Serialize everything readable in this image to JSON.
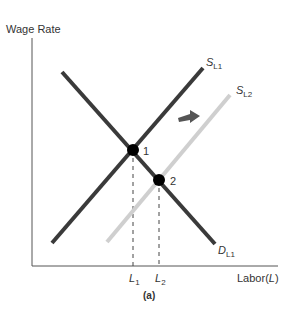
{
  "diagram": {
    "y_axis_label": "Wage Rate",
    "x_axis_label_prefix": "Labor(",
    "x_axis_label_var": "L",
    "x_axis_label_suffix": ")",
    "caption": "(a)",
    "shift_arrow_icon": "right-arrow-icon"
  },
  "curves": {
    "supply_1": {
      "main": "S",
      "sub": "L1",
      "color": "#3a3a3a",
      "from": [
        52,
        243
      ],
      "to": [
        203,
        68
      ]
    },
    "supply_2": {
      "main": "S",
      "sub": "L2",
      "color": "#cfcfcf",
      "from": [
        107,
        242
      ],
      "to": [
        230,
        95
      ]
    },
    "demand_1": {
      "main": "D",
      "sub": "L1",
      "color": "#3a3a3a",
      "from": [
        62,
        72
      ],
      "to": [
        215,
        244
      ]
    }
  },
  "equilibria": [
    {
      "label": "1",
      "x": 133,
      "y": 150
    },
    {
      "label": "2",
      "x": 159,
      "y": 180
    }
  ],
  "ticks": [
    {
      "main": "L",
      "sub": "1",
      "x": 135
    },
    {
      "main": "L",
      "sub": "2",
      "x": 160
    }
  ],
  "colors": {
    "axis": "#555555",
    "dark_curve": "#3a3a3a",
    "light_curve": "#cfcfcf",
    "arrow": "#555555",
    "point": "#000000"
  }
}
